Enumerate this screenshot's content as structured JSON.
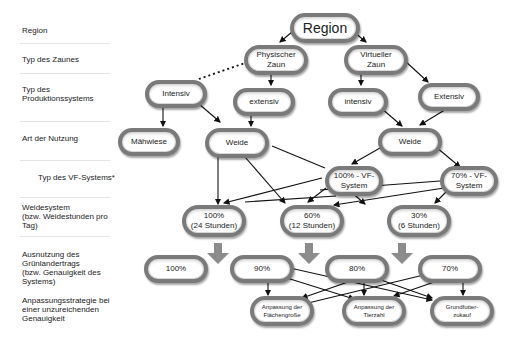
{
  "row_labels": [
    {
      "text": "Region"
    },
    {
      "text": "Typ des Zaunes"
    },
    {
      "text": "Typ des\nProduktionssystems"
    },
    {
      "text": "Art der Nutzung"
    },
    {
      "text": "Typ des VF-Systems*"
    },
    {
      "text": "Weidesystem\n(bzw. Weidestunden pro\nTag)"
    },
    {
      "text": "Ausnutzung des\nGrünlandertrags\n(bzw. Genauigkeit des\nSystems)"
    },
    {
      "text": "Anpassungsstrategie bei\neiner unzureichenden\nGenauigkeit"
    }
  ],
  "nodes": {
    "region": "Region",
    "physischer_zaun": "Physischer\nZaun",
    "virtueller_zaun": "Virtueller\nZaun",
    "intensiv_left": "Intensiv",
    "extensiv_mid": "extensiv",
    "intensiv_right": "intensiv",
    "extensiv_right": "Extensiv",
    "maehwiese": "Mähwiese",
    "weide_left": "Weide",
    "weide_right": "Weide",
    "vf100": "100% - VF-\nSystem",
    "vf70": "70% - VF-\nSystem",
    "ws100": "100%\n(24 Stunden)",
    "ws60": "60%\n(12 Stunden)",
    "ws30": "30%\n(6 Stunden)",
    "g100": "100%",
    "g90": "90%",
    "g80": "80%",
    "g70": "70%",
    "anp_flaeche": "Anpassung der\nFlächengroße",
    "anp_tierzahl": "Anpassung der\nTierzahl",
    "grundfutter": "Grundfutter-\nzukauf"
  },
  "colors": {
    "node_border": "#7a7a7a",
    "arrow": "#111111",
    "big_arrow": "#8c8c8c"
  }
}
